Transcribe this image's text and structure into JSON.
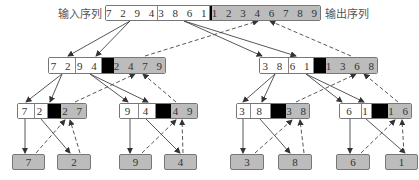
{
  "labels": {
    "input": "输入序列",
    "output": "输出序列"
  },
  "colors": {
    "sorted": "#bcbcbc",
    "separator": "#000000",
    "unsorted": "#ffffff"
  },
  "root": {
    "left": "7 2 9 4",
    "right": "3 8 6 1",
    "sorted": "1 2 3 4 6 7 8 9"
  },
  "level2": [
    {
      "left": "7 2",
      "right": "9 4",
      "sorted": "2 4 7 9"
    },
    {
      "left": "3 8",
      "right": "6 1",
      "sorted": "1 3 6 8"
    }
  ],
  "level3": [
    {
      "left": "7",
      "right": "2",
      "sorted": "2 7"
    },
    {
      "left": "9",
      "right": "4",
      "sorted": "4 9"
    },
    {
      "left": "3",
      "right": "8",
      "sorted": "3 8"
    },
    {
      "left": "6",
      "right": "1",
      "sorted": "1 6"
    }
  ],
  "leaves": [
    "7",
    "2",
    "9",
    "4",
    "3",
    "8",
    "6",
    "1"
  ],
  "legend": {
    "solid_arrow": "divide",
    "dashed_arrow": "merge"
  }
}
